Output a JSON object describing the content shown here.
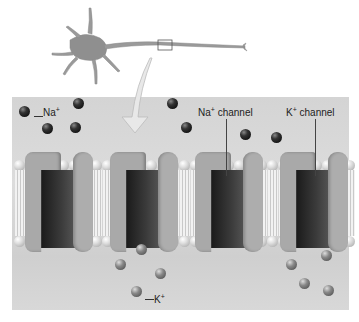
{
  "labels": {
    "na_ion": {
      "text": "Na",
      "charge": "+"
    },
    "k_ion": {
      "text": "K",
      "charge": "+"
    },
    "na_channel": {
      "text": "Na",
      "charge": "+",
      "suffix": " channel"
    },
    "k_channel": {
      "text": "K",
      "charge": "+",
      "suffix": " channel"
    }
  },
  "colors": {
    "panel": "#d6d6d6",
    "channel_protein": "#aaaaaa",
    "pore": "#222222",
    "na_ion": "#222222",
    "k_ion": "#888888"
  },
  "na_ions": [
    [
      24,
      111
    ],
    [
      78,
      103
    ],
    [
      47,
      128
    ],
    [
      75,
      127
    ],
    [
      172,
      103
    ],
    [
      186,
      127
    ],
    [
      245,
      134
    ],
    [
      276,
      137
    ]
  ],
  "k_ions": [
    [
      141,
      249
    ],
    [
      120,
      264
    ],
    [
      160,
      273
    ],
    [
      136,
      291
    ],
    [
      291,
      264
    ],
    [
      326,
      255
    ],
    [
      304,
      283
    ],
    [
      328,
      290
    ]
  ],
  "channels_x": [
    25,
    110,
    195,
    280
  ]
}
